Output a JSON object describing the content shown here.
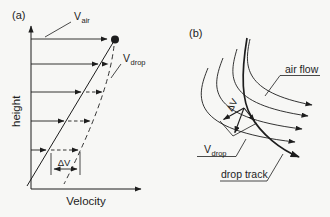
{
  "figure": {
    "ink_color": "#1d1d1d",
    "background_color": "#f7f7f5",
    "panel_a": {
      "tag": "(a)",
      "y_axis_label": "height",
      "x_axis_label": "Velocity",
      "v_air_label": {
        "main": "V",
        "sub": "air"
      },
      "v_drop_label": {
        "main": "V",
        "sub": "drop"
      },
      "delta_v_label": "ΔV"
    },
    "panel_b": {
      "tag": "(b)",
      "air_flow_label": "air flow",
      "drop_track_label": "drop track",
      "v_drop_label": {
        "main": "V",
        "sub": "drop"
      },
      "delta_v_label": "ΔV"
    }
  }
}
